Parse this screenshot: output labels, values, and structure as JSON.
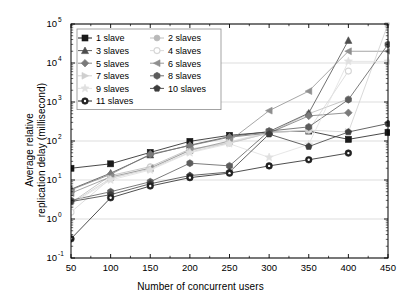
{
  "chart_data": {
    "type": "line",
    "title": "",
    "xlabel": "Number of concurrent users",
    "ylabel_line1": "Average relative",
    "ylabel_line2": "replication delay (millisecond)",
    "ylabel": "Average relative replication delay (millisecond)",
    "yscale": "log",
    "xscale": "linear",
    "xlim": [
      50,
      450
    ],
    "ylim": [
      0.1,
      100000
    ],
    "xticks": [
      50,
      100,
      150,
      200,
      250,
      300,
      350,
      400,
      450
    ],
    "xticklabels": [
      "50",
      "100",
      "150",
      "200",
      "250",
      "300",
      "350",
      "400",
      "450"
    ],
    "yticks": [
      0.1,
      1,
      10,
      100,
      1000,
      10000,
      100000
    ],
    "yticklabels": [
      "10-1",
      "100",
      "101",
      "102",
      "103",
      "104",
      "105"
    ],
    "ytick_mantissa": [
      "10",
      "10",
      "10",
      "10",
      "10",
      "10",
      "10"
    ],
    "ytick_exponent": [
      "-1",
      "0",
      "1",
      "2",
      "3",
      "4",
      "5"
    ],
    "grid": "horizontal-major",
    "legend_position": "upper-left-inside",
    "legend_columns": 2,
    "x": [
      50,
      100,
      150,
      200,
      250,
      300,
      350,
      400,
      450
    ],
    "series": [
      {
        "name": "1 slave",
        "marker": "square",
        "color": "#1a1a1a",
        "values": [
          20,
          26,
          51,
          98,
          140,
          170,
          180,
          110,
          165
        ]
      },
      {
        "name": "2 slaves",
        "marker": "circle",
        "color": "#b9b9b9",
        "values": [
          2.6,
          13,
          22,
          62,
          88,
          160,
          500,
          1200,
          null
        ]
      },
      {
        "name": "3 slaves",
        "marker": "triangle-up",
        "color": "#4d4d4d",
        "values": [
          5.8,
          15,
          44,
          78,
          130,
          175,
          520,
          38000,
          null
        ]
      },
      {
        "name": "4 slaves",
        "marker": "circle-open",
        "color": "#d6d6d6",
        "values": [
          1.5,
          11,
          21,
          56,
          95,
          170,
          190,
          6200,
          null
        ]
      },
      {
        "name": "5 slaves",
        "marker": "diamond",
        "color": "#7a7a7a",
        "values": [
          5.6,
          14,
          46,
          76,
          125,
          160,
          440,
          530,
          null
        ]
      },
      {
        "name": "6 slaves",
        "marker": "triangle-left",
        "color": "#8f8f8f",
        "values": [
          4.6,
          12,
          20,
          58,
          100,
          600,
          1900,
          20000,
          20000
        ]
      },
      {
        "name": "7 slaves",
        "marker": "triangle-right",
        "color": "#cfcfcf",
        "values": [
          2.5,
          11,
          19,
          52,
          90,
          160,
          190,
          170,
          100000
        ]
      },
      {
        "name": "8 slaves",
        "marker": "hexagon",
        "color": "#5c5c5c",
        "values": [
          3.0,
          5.0,
          9.0,
          27,
          23,
          180,
          230,
          1150,
          30000
        ]
      },
      {
        "name": "9 slaves",
        "marker": "star",
        "color": "#e0e0e0",
        "values": [
          2.4,
          10,
          18,
          50,
          85,
          38,
          82,
          11000,
          11000
        ]
      },
      {
        "name": "10 slaves",
        "marker": "pentagon",
        "color": "#3d3d3d",
        "values": [
          2.8,
          4.2,
          8.0,
          13,
          16,
          150,
          72,
          170,
          280
        ]
      },
      {
        "name": "11 slaves",
        "marker": "circle-dot",
        "color": "#222222",
        "values": [
          0.31,
          3.5,
          7.0,
          11.5,
          15,
          23,
          33,
          49,
          null
        ]
      }
    ]
  },
  "legend": {
    "items": [
      {
        "label": "1 slave"
      },
      {
        "label": "2 slaves"
      },
      {
        "label": "3 slaves"
      },
      {
        "label": "4 slaves"
      },
      {
        "label": "5 slaves"
      },
      {
        "label": "6 slaves"
      },
      {
        "label": "7 slaves"
      },
      {
        "label": "8 slaves"
      },
      {
        "label": "9 slaves"
      },
      {
        "label": "10 slaves"
      },
      {
        "label": "11 slaves"
      }
    ]
  }
}
